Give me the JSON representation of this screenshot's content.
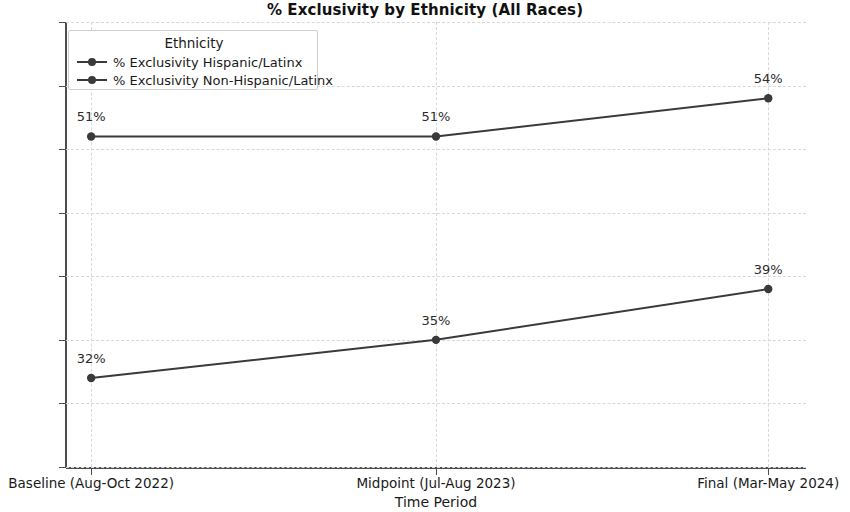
{
  "chart_data": {
    "type": "line",
    "title": "% Exclusivity by Ethnicity (All Races)",
    "xlabel": "Time Period",
    "ylabel": "% Exclusivity",
    "categories": [
      "Baseline (Aug-Oct 2022)",
      "Midpoint (Jul-Aug 2023)",
      "Final (Mar-May 2024)"
    ],
    "series": [
      {
        "name": "% Exclusivity Hispanic/Latinx",
        "values": [
          51,
          51,
          54
        ],
        "point_labels": [
          "51%",
          "51%",
          "54%"
        ],
        "color": "#3a3a3a"
      },
      {
        "name": "% Exclusivity Non-Hispanic/Latinx",
        "values": [
          32,
          35,
          39
        ],
        "point_labels": [
          "32%",
          "35%",
          "39%"
        ],
        "color": "#3a3a3a"
      }
    ],
    "ylim": [
      25,
      60
    ],
    "yticks": [
      25,
      30,
      35,
      40,
      45,
      50,
      55,
      60
    ],
    "ytick_labels": [
      "25",
      "30",
      "35",
      "40",
      "45",
      "50",
      "55",
      "60"
    ],
    "grid": true,
    "grid_style": "dashed",
    "grid_color": "#d8d8d8",
    "legend_position": "upper left",
    "legend_title": "Ethnicity"
  },
  "axes": {
    "axis_color": "#4d4d4d"
  }
}
